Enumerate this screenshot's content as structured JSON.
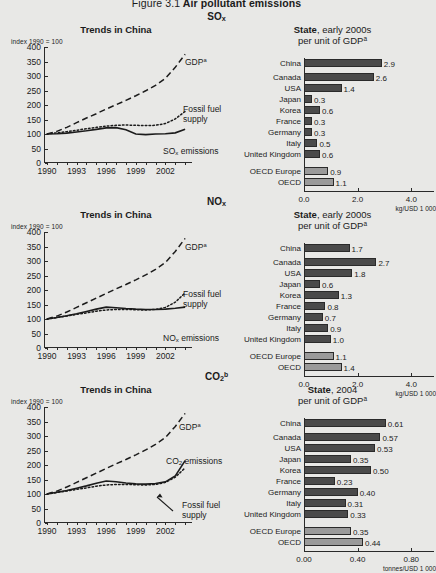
{
  "figure": {
    "number": "Figure 3.1",
    "title": "Air pollutant emissions"
  },
  "sections": [
    {
      "id": "so2",
      "heading_main": "SO",
      "heading_sub": "x",
      "heading_sup": "",
      "left": {
        "title": "Trends in China",
        "index_label": "index 1990 = 100",
        "yticks": [
          "400",
          "350",
          "300",
          "250",
          "200",
          "150",
          "100",
          "50",
          "0"
        ],
        "xticks": [
          "1990",
          "1993",
          "1996",
          "1999",
          "2002"
        ],
        "labels": {
          "gdp": "GDP",
          "gdp_sup": "a",
          "fossil_line1": "Fossil fuel",
          "fossil_line2": "supply",
          "emissions": "SO",
          "emissions_sub": "x",
          "emissions_tail": " emissions"
        }
      },
      "right": {
        "title_bold": "State",
        "title_rest": ", early 2000s",
        "subtitle": "per unit of GDP",
        "subtitle_sup": "a",
        "unit": "kg/USD 1 000",
        "xmax": 4.4,
        "xticks": [
          "0.0",
          "2.0",
          "4.0"
        ],
        "xtickvals": [
          0.0,
          2.0,
          4.0
        ],
        "rows": [
          {
            "label": "China",
            "value": 2.9,
            "display": "2.9",
            "group": "country"
          },
          {
            "label": "Canada",
            "value": 2.6,
            "display": "2.6",
            "group": "country"
          },
          {
            "label": "USA",
            "value": 1.4,
            "display": "1.4",
            "group": "country"
          },
          {
            "label": "Japan",
            "value": 0.3,
            "display": "0.3",
            "group": "country"
          },
          {
            "label": "Korea",
            "value": 0.6,
            "display": "0.6",
            "group": "country"
          },
          {
            "label": "France",
            "value": 0.3,
            "display": "0.3",
            "group": "country"
          },
          {
            "label": "Germany",
            "value": 0.3,
            "display": "0.3",
            "group": "country"
          },
          {
            "label": "Italy",
            "value": 0.5,
            "display": "0.5",
            "group": "country"
          },
          {
            "label": "United Kingdom",
            "value": 0.6,
            "display": "0.6",
            "group": "country"
          },
          {
            "label": "OECD Europe",
            "value": 0.9,
            "display": "0.9",
            "group": "aggregate"
          },
          {
            "label": "OECD",
            "value": 1.1,
            "display": "1.1",
            "group": "aggregate"
          }
        ]
      }
    },
    {
      "id": "nox",
      "heading_main": "NO",
      "heading_sub": "x",
      "heading_sup": "",
      "left": {
        "title": "Trends in China",
        "index_label": "index 1990 = 100",
        "yticks": [
          "400",
          "350",
          "300",
          "250",
          "200",
          "150",
          "100",
          "50",
          "0"
        ],
        "xticks": [
          "1990",
          "1993",
          "1996",
          "1999",
          "2002"
        ],
        "labels": {
          "gdp": "GDP",
          "gdp_sup": "a",
          "fossil_line1": "Fossil fuel",
          "fossil_line2": "supply",
          "emissions": "NO",
          "emissions_sub": "x",
          "emissions_tail": " emissions"
        }
      },
      "right": {
        "title_bold": "State",
        "title_rest": ", early 2000s",
        "subtitle": "per unit of GDP",
        "subtitle_sup": "a",
        "unit": "kg/USD 1 000",
        "xmax": 4.4,
        "xticks": [
          "0.0",
          "2.0",
          "4.0"
        ],
        "xtickvals": [
          0.0,
          2.0,
          4.0
        ],
        "rows": [
          {
            "label": "China",
            "value": 1.7,
            "display": "1.7",
            "group": "country"
          },
          {
            "label": "Canada",
            "value": 2.7,
            "display": "2.7",
            "group": "country"
          },
          {
            "label": "USA",
            "value": 1.8,
            "display": "1.8",
            "group": "country"
          },
          {
            "label": "Japan",
            "value": 0.6,
            "display": "0.6",
            "group": "country"
          },
          {
            "label": "Korea",
            "value": 1.3,
            "display": "1.3",
            "group": "country"
          },
          {
            "label": "France",
            "value": 0.8,
            "display": "0.8",
            "group": "country"
          },
          {
            "label": "Germany",
            "value": 0.7,
            "display": "0.7",
            "group": "country"
          },
          {
            "label": "Italy",
            "value": 0.9,
            "display": "0.9",
            "group": "country"
          },
          {
            "label": "United Kingdom",
            "value": 1.0,
            "display": "1.0",
            "group": "country"
          },
          {
            "label": "OECD Europe",
            "value": 1.1,
            "display": "1.1",
            "group": "aggregate"
          },
          {
            "label": "OECD",
            "value": 1.4,
            "display": "1.4",
            "group": "aggregate"
          }
        ]
      }
    },
    {
      "id": "co2",
      "heading_main": "CO",
      "heading_sub": "2",
      "heading_sup": "b",
      "left": {
        "title": "Trends in China",
        "index_label": "index 1990 = 100",
        "yticks": [
          "400",
          "350",
          "300",
          "250",
          "200",
          "150",
          "100",
          "50",
          "0"
        ],
        "xticks": [
          "1990",
          "1993",
          "1996",
          "1999",
          "2002"
        ],
        "labels": {
          "gdp": "GDP",
          "gdp_sup": "a",
          "fossil_line1": "Fossil fuel",
          "fossil_line2": "supply",
          "emissions": "CO",
          "emissions_sub": "2",
          "emissions_tail": " emissions"
        }
      },
      "right": {
        "title_bold": "State",
        "title_rest": ", 2004",
        "subtitle": "per unit of GDP",
        "subtitle_sup": "a",
        "unit": "tonnes/USD 1 000",
        "xmax": 0.88,
        "xticks": [
          "0.00",
          "0.40",
          "0.80"
        ],
        "xtickvals": [
          0.0,
          0.4,
          0.8
        ],
        "rows": [
          {
            "label": "China",
            "value": 0.61,
            "display": "0.61",
            "group": "country"
          },
          {
            "label": "Canada",
            "value": 0.57,
            "display": "0.57",
            "group": "country"
          },
          {
            "label": "USA",
            "value": 0.53,
            "display": "0.53",
            "group": "country"
          },
          {
            "label": "Japan",
            "value": 0.35,
            "display": "0.35",
            "group": "country"
          },
          {
            "label": "Korea",
            "value": 0.5,
            "display": "0.50",
            "group": "country"
          },
          {
            "label": "France",
            "value": 0.23,
            "display": "0.23",
            "group": "country"
          },
          {
            "label": "Germany",
            "value": 0.4,
            "display": "0.40",
            "group": "country"
          },
          {
            "label": "Italy",
            "value": 0.31,
            "display": "0.31",
            "group": "country"
          },
          {
            "label": "United Kingdom",
            "value": 0.33,
            "display": "0.33",
            "group": "country"
          },
          {
            "label": "OECD Europe",
            "value": 0.35,
            "display": "0.35",
            "group": "aggregate"
          },
          {
            "label": "OECD",
            "value": 0.44,
            "display": "0.44",
            "group": "aggregate"
          }
        ]
      }
    }
  ],
  "chart_data": [
    {
      "type": "line",
      "title": "SOx — Trends in China",
      "xlabel": "",
      "ylabel": "index 1990 = 100",
      "ylim": [
        0,
        400
      ],
      "xlim": [
        1990,
        2004
      ],
      "x": [
        1990,
        1991,
        1992,
        1993,
        1994,
        1995,
        1996,
        1997,
        1998,
        1999,
        2000,
        2001,
        2002,
        2003,
        2004
      ],
      "series": [
        {
          "name": "GDP",
          "style": "dashed",
          "values": [
            100,
            109,
            123,
            139,
            155,
            170,
            186,
            201,
            216,
            232,
            249,
            268,
            292,
            330,
            375
          ]
        },
        {
          "name": "Fossil fuel supply",
          "style": "dotted",
          "values": [
            100,
            104,
            108,
            113,
            118,
            123,
            127,
            130,
            131,
            130,
            129,
            130,
            136,
            152,
            178
          ]
        },
        {
          "name": "SOx emissions",
          "style": "solid",
          "values": [
            100,
            101,
            103,
            107,
            111,
            116,
            121,
            122,
            115,
            100,
            98,
            100,
            101,
            104,
            116
          ]
        }
      ]
    },
    {
      "type": "bar",
      "orientation": "horizontal",
      "title": "SOx — State, early 2000s per unit of GDP",
      "xlabel": "kg/USD 1 000",
      "xlim": [
        0,
        4.4
      ],
      "categories": [
        "China",
        "Canada",
        "USA",
        "Japan",
        "Korea",
        "France",
        "Germany",
        "Italy",
        "United Kingdom",
        "OECD Europe",
        "OECD"
      ],
      "values": [
        2.9,
        2.6,
        1.4,
        0.3,
        0.6,
        0.3,
        0.3,
        0.5,
        0.6,
        0.9,
        1.1
      ]
    },
    {
      "type": "line",
      "title": "NOx — Trends in China",
      "xlabel": "",
      "ylabel": "index 1990 = 100",
      "ylim": [
        0,
        400
      ],
      "xlim": [
        1990,
        2004
      ],
      "x": [
        1990,
        1991,
        1992,
        1993,
        1994,
        1995,
        1996,
        1997,
        1998,
        1999,
        2000,
        2001,
        2002,
        2003,
        2004
      ],
      "series": [
        {
          "name": "GDP",
          "style": "dashed",
          "values": [
            100,
            110,
            124,
            140,
            156,
            172,
            188,
            204,
            219,
            235,
            252,
            271,
            295,
            333,
            378
          ]
        },
        {
          "name": "Fossil fuel supply",
          "style": "dotted",
          "values": [
            100,
            105,
            110,
            116,
            121,
            127,
            131,
            133,
            133,
            132,
            131,
            133,
            140,
            158,
            190
          ]
        },
        {
          "name": "NOx emissions",
          "style": "solid",
          "values": [
            100,
            105,
            111,
            118,
            126,
            134,
            141,
            139,
            136,
            134,
            133,
            133,
            134,
            137,
            141
          ]
        }
      ]
    },
    {
      "type": "bar",
      "orientation": "horizontal",
      "title": "NOx — State, early 2000s per unit of GDP",
      "xlabel": "kg/USD 1 000",
      "xlim": [
        0,
        4.4
      ],
      "categories": [
        "China",
        "Canada",
        "USA",
        "Japan",
        "Korea",
        "France",
        "Germany",
        "Italy",
        "United Kingdom",
        "OECD Europe",
        "OECD"
      ],
      "values": [
        1.7,
        2.7,
        1.8,
        0.6,
        1.3,
        0.8,
        0.7,
        0.9,
        1.0,
        1.1,
        1.4
      ]
    },
    {
      "type": "line",
      "title": "CO2 — Trends in China",
      "xlabel": "",
      "ylabel": "index 1990 = 100",
      "ylim": [
        0,
        400
      ],
      "xlim": [
        1990,
        2004
      ],
      "x": [
        1990,
        1991,
        1992,
        1993,
        1994,
        1995,
        1996,
        1997,
        1998,
        1999,
        2000,
        2001,
        2002,
        2003,
        2004
      ],
      "series": [
        {
          "name": "GDP",
          "style": "dashed",
          "values": [
            100,
            110,
            124,
            140,
            156,
            172,
            188,
            204,
            219,
            235,
            252,
            271,
            295,
            333,
            378
          ]
        },
        {
          "name": "Fossil fuel supply",
          "style": "dotted",
          "values": [
            100,
            105,
            110,
            116,
            121,
            127,
            131,
            133,
            133,
            132,
            131,
            133,
            140,
            158,
            190
          ]
        },
        {
          "name": "CO2 emissions",
          "style": "solid",
          "values": [
            100,
            106,
            112,
            120,
            128,
            137,
            145,
            142,
            138,
            135,
            134,
            136,
            142,
            162,
            215
          ]
        }
      ]
    },
    {
      "type": "bar",
      "orientation": "horizontal",
      "title": "CO2 — State, 2004 per unit of GDP",
      "xlabel": "tonnes/USD 1 000",
      "xlim": [
        0,
        0.88
      ],
      "categories": [
        "China",
        "Canada",
        "USA",
        "Japan",
        "Korea",
        "France",
        "Germany",
        "Italy",
        "United Kingdom",
        "OECD Europe",
        "OECD"
      ],
      "values": [
        0.61,
        0.57,
        0.53,
        0.35,
        0.5,
        0.23,
        0.4,
        0.31,
        0.33,
        0.35,
        0.44
      ]
    }
  ]
}
